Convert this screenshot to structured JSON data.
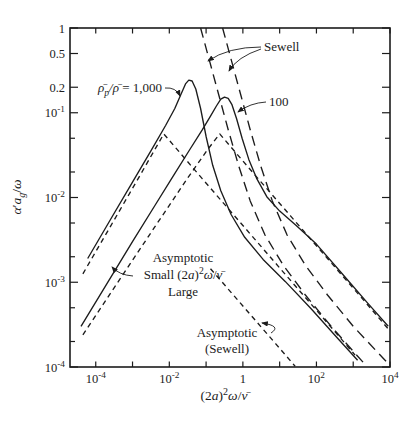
{
  "figure": {
    "width": 417,
    "height": 427,
    "bg": "#ffffff",
    "ink": "#1c1c1c"
  },
  "chart_data": {
    "type": "line",
    "title": "",
    "xlabel": "(2a)²ω/ν̄",
    "ylabel": "α′a_g/ω",
    "x_log_range": [
      -4.7,
      4
    ],
    "y_log_range": [
      -4,
      0
    ],
    "grid": false,
    "legend_position": "none",
    "plot_px": {
      "left": 70,
      "top": 28,
      "right": 390,
      "bottom": 367
    },
    "xlabel_pos": {
      "x": 224,
      "y": 400
    },
    "ylabel_pos": {
      "x": 21,
      "y": 197
    },
    "xlabel_parts": [
      {
        "t": "(2"
      },
      {
        "t": "a",
        "it": 1
      },
      {
        "t": ")"
      },
      {
        "t": "2",
        "sup": 1
      },
      {
        "t": "ω",
        "it": 1
      },
      {
        "t": "/"
      },
      {
        "t": "ν̄",
        "it": 1
      }
    ],
    "ylabel_parts": [
      {
        "t": "α",
        "it": 1
      },
      {
        "t": "′"
      },
      {
        "t": "a",
        "it": 1
      },
      {
        "t": "g",
        "it": 1,
        "sub": 1
      },
      {
        "t": "/"
      },
      {
        "t": "ω",
        "it": 1
      }
    ],
    "x_ticks": [
      {
        "lx": -4,
        "label": "10^-4"
      },
      {
        "lx": -3
      },
      {
        "lx": -2,
        "label": "10^-2"
      },
      {
        "lx": -1
      },
      {
        "lx": 0,
        "label": "1"
      },
      {
        "lx": 1
      },
      {
        "lx": 2,
        "label": "10^2"
      },
      {
        "lx": 3
      },
      {
        "lx": 4,
        "label": "10^4"
      }
    ],
    "y_ticks": [
      {
        "ly": 0,
        "label": "1"
      },
      {
        "ly": -0.301,
        "label": "0.5"
      },
      {
        "ly": -0.699,
        "label": "0.2"
      },
      {
        "ly": -1,
        "label": "10^-1"
      },
      {
        "ly": -1.301
      },
      {
        "ly": -1.699
      },
      {
        "ly": -2,
        "label": "10^-2"
      },
      {
        "ly": -2.301
      },
      {
        "ly": -2.699
      },
      {
        "ly": -3,
        "label": "10^-3"
      },
      {
        "ly": -3.301
      },
      {
        "ly": -3.699
      },
      {
        "ly": -4,
        "label": "10^-4"
      }
    ],
    "series": [
      {
        "id": "curve-exact-1000",
        "name": "exact theory, ρ̄p/ρ̄ = 1,000",
        "dash": "solid",
        "points": [
          [
            -4.22,
            -2.72
          ],
          [
            -3.6,
            -2.26
          ],
          [
            -3.0,
            -1.82
          ],
          [
            -2.5,
            -1.45
          ],
          [
            -2.1,
            -1.15
          ],
          [
            -1.85,
            -0.95
          ],
          [
            -1.68,
            -0.78
          ],
          [
            -1.56,
            -0.66
          ],
          [
            -1.47,
            -0.615
          ],
          [
            -1.38,
            -0.625
          ],
          [
            -1.28,
            -0.72
          ],
          [
            -1.15,
            -0.95
          ],
          [
            -1.0,
            -1.28
          ],
          [
            -0.82,
            -1.62
          ],
          [
            -0.6,
            -1.92
          ],
          [
            -0.32,
            -2.2
          ],
          [
            0.05,
            -2.47
          ],
          [
            0.55,
            -2.73
          ],
          [
            1.15,
            -2.99
          ],
          [
            1.85,
            -3.31
          ],
          [
            2.55,
            -3.65
          ],
          [
            3.12,
            -3.92
          ]
        ]
      },
      {
        "id": "curve-exact-100",
        "name": "exact theory, ρ̄p/ρ̄ = 100",
        "dash": "solid",
        "points": [
          [
            -4.4,
            -3.52
          ],
          [
            -3.7,
            -3.02
          ],
          [
            -3.0,
            -2.52
          ],
          [
            -2.4,
            -2.1
          ],
          [
            -1.9,
            -1.75
          ],
          [
            -1.45,
            -1.44
          ],
          [
            -1.1,
            -1.2
          ],
          [
            -0.88,
            -1.04
          ],
          [
            -0.72,
            -0.92
          ],
          [
            -0.6,
            -0.84
          ],
          [
            -0.5,
            -0.815
          ],
          [
            -0.4,
            -0.83
          ],
          [
            -0.3,
            -0.9
          ],
          [
            -0.17,
            -1.07
          ],
          [
            -0.02,
            -1.3
          ],
          [
            0.16,
            -1.55
          ],
          [
            0.38,
            -1.78
          ],
          [
            0.65,
            -1.99
          ],
          [
            1.0,
            -2.16
          ],
          [
            1.45,
            -2.33
          ],
          [
            2.0,
            -2.55
          ],
          [
            2.7,
            -2.9
          ],
          [
            3.4,
            -3.25
          ],
          [
            3.95,
            -3.52
          ]
        ]
      },
      {
        "id": "curve-sewell-1000",
        "name": "Sewell theory, 1,000",
        "dash": "long",
        "points": [
          [
            -1.15,
            0
          ],
          [
            -0.9,
            -0.4
          ],
          [
            -0.65,
            -0.8
          ],
          [
            -0.4,
            -1.2
          ],
          [
            -0.12,
            -1.62
          ],
          [
            0.2,
            -2.04
          ],
          [
            0.6,
            -2.44
          ],
          [
            1.1,
            -2.8
          ],
          [
            1.7,
            -3.15
          ],
          [
            2.4,
            -3.52
          ],
          [
            3.05,
            -3.84
          ],
          [
            3.3,
            -3.96
          ]
        ]
      },
      {
        "id": "curve-sewell-100",
        "name": "Sewell theory, 100",
        "dash": "long",
        "points": [
          [
            -0.55,
            0
          ],
          [
            -0.3,
            -0.4
          ],
          [
            -0.05,
            -0.8
          ],
          [
            0.2,
            -1.2
          ],
          [
            0.48,
            -1.62
          ],
          [
            0.8,
            -2.04
          ],
          [
            1.2,
            -2.44
          ],
          [
            1.7,
            -2.8
          ],
          [
            2.3,
            -3.15
          ],
          [
            3.0,
            -3.52
          ],
          [
            3.95,
            -3.96
          ]
        ]
      },
      {
        "id": "curve-asymptotic-1000",
        "name": "asymptotic small/large limits, 1,000",
        "dash": "short",
        "points": [
          [
            -4.35,
            -2.9
          ],
          [
            -3.6,
            -2.34
          ],
          [
            -2.85,
            -1.78
          ],
          [
            -2.15,
            -1.25
          ],
          [
            -1.1,
            -1.78
          ],
          [
            0.0,
            -2.33
          ],
          [
            1.1,
            -2.88
          ],
          [
            2.2,
            -3.43
          ],
          [
            3.05,
            -3.86
          ]
        ]
      },
      {
        "id": "curve-asymptotic-100",
        "name": "asymptotic small/large limits, 100",
        "dash": "short",
        "points": [
          [
            -4.35,
            -3.62
          ],
          [
            -3.4,
            -3.0
          ],
          [
            -2.4,
            -2.35
          ],
          [
            -1.5,
            -1.77
          ],
          [
            -0.95,
            -1.43
          ],
          [
            -0.63,
            -1.25
          ],
          [
            0.3,
            -1.72
          ],
          [
            1.3,
            -2.22
          ],
          [
            2.3,
            -2.72
          ],
          [
            3.3,
            -3.22
          ],
          [
            3.95,
            -3.55
          ]
        ]
      },
      {
        "id": "curve-asymptotic-sewell",
        "name": "asymptotic (Sewell)",
        "dash": "short",
        "points": [
          [
            -0.88,
            -2.84
          ],
          [
            0.0,
            -3.28
          ],
          [
            0.9,
            -3.73
          ],
          [
            1.42,
            -3.99
          ]
        ]
      }
    ],
    "annotations": [
      {
        "id": "annotation-density-ratio",
        "x": 162,
        "y": 92,
        "align": "end",
        "fs": 13,
        "line_h": 16,
        "lines": [
          [
            {
              "t": "ρ̄",
              "it": 1
            },
            {
              "t": "p",
              "it": 1,
              "sub": 1
            },
            {
              "t": "/",
              "it": 1
            },
            {
              "t": "ρ̄",
              "it": 1
            },
            {
              "t": " = 1,000"
            }
          ]
        ],
        "leaders": [
          [
            165,
            88,
            176,
            87,
            180,
            96
          ]
        ]
      },
      {
        "id": "annotation-100",
        "x": 269,
        "y": 106,
        "align": "start",
        "fs": 13,
        "line_h": 16,
        "lines": [
          [
            {
              "t": "100"
            }
          ]
        ],
        "leaders": [
          [
            266,
            102,
            250,
            103,
            238,
            112
          ]
        ]
      },
      {
        "id": "annotation-sewell",
        "x": 264,
        "y": 51,
        "align": "start",
        "fs": 13,
        "line_h": 16,
        "lines": [
          [
            {
              "t": "Sewell"
            }
          ]
        ],
        "leaders": [
          [
            261,
            47,
            228,
            47,
            208,
            61
          ],
          [
            261,
            49,
            237,
            57,
            229,
            71
          ]
        ]
      },
      {
        "id": "annotation-asymptotic-small-large",
        "x": 183,
        "y": 262,
        "align": "middle",
        "fs": 13,
        "line_h": 17,
        "lines": [
          [
            {
              "t": "Asymptotic"
            }
          ],
          [
            {
              "t": "Small (2"
            },
            {
              "t": "a",
              "it": 1
            },
            {
              "t": ")"
            },
            {
              "t": "2",
              "sup": 1
            },
            {
              "t": "ω",
              "it": 1
            },
            {
              "t": "/"
            },
            {
              "t": "ν̄",
              "it": 1
            }
          ],
          [
            {
              "t": "Large"
            }
          ]
        ],
        "leaders": [
          [
            133,
            276,
            119,
            275,
            112,
            267
          ]
        ]
      },
      {
        "id": "annotation-asymptotic-sewell",
        "x": 227,
        "y": 337,
        "align": "middle",
        "fs": 13,
        "line_h": 16,
        "lines": [
          [
            {
              "t": "Asymptotic"
            }
          ],
          [
            {
              "t": "(Sewell)"
            }
          ]
        ],
        "leaders": [
          [
            271,
            333,
            282,
            326,
            262,
            323
          ]
        ]
      }
    ]
  }
}
